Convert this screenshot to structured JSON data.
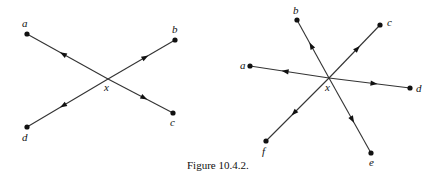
{
  "caption": "Figure 10.4.2.",
  "colors": {
    "ink": "#111111",
    "edge": "#333333",
    "background": "#ffffff"
  },
  "figures": [
    {
      "id": "left",
      "center": {
        "label": "x",
        "pos": [
          108,
          79
        ],
        "label_pos": [
          104,
          91
        ]
      },
      "nodes": [
        {
          "label": "a",
          "pos": [
            27,
            34
          ],
          "label_pos": [
            22,
            27
          ]
        },
        {
          "label": "b",
          "pos": [
            175,
            40
          ],
          "label_pos": [
            172,
            33
          ]
        },
        {
          "label": "c",
          "pos": [
            173,
            113
          ],
          "label_pos": [
            170,
            126
          ]
        },
        {
          "label": "d",
          "pos": [
            27,
            127
          ],
          "label_pos": [
            22,
            141
          ]
        }
      ],
      "edges": [
        {
          "from": "x",
          "to": "a",
          "arrow_direction": "outward"
        },
        {
          "from": "x",
          "to": "b",
          "arrow_direction": "outward"
        },
        {
          "from": "x",
          "to": "c",
          "arrow_direction": "outward"
        },
        {
          "from": "x",
          "to": "d",
          "arrow_direction": "outward"
        }
      ]
    },
    {
      "id": "right",
      "center": {
        "label": "x",
        "pos": [
          329,
          78
        ],
        "label_pos": [
          325,
          91
        ]
      },
      "nodes": [
        {
          "label": "a",
          "pos": [
            250,
            66
          ],
          "label_pos": [
            240,
            69
          ]
        },
        {
          "label": "b",
          "pos": [
            297,
            20
          ],
          "label_pos": [
            293,
            14
          ]
        },
        {
          "label": "c",
          "pos": [
            380,
            25
          ],
          "label_pos": [
            387,
            26
          ]
        },
        {
          "label": "d",
          "pos": [
            410,
            88
          ],
          "label_pos": [
            416,
            92
          ]
        },
        {
          "label": "e",
          "pos": [
            371,
            153
          ],
          "label_pos": [
            369,
            166
          ]
        },
        {
          "label": "f",
          "pos": [
            266,
            141
          ],
          "label_pos": [
            262,
            155
          ]
        }
      ],
      "edges": [
        {
          "from": "x",
          "to": "a",
          "arrow_direction": "outward"
        },
        {
          "from": "x",
          "to": "b",
          "arrow_direction": "outward"
        },
        {
          "from": "x",
          "to": "c",
          "arrow_direction": "outward"
        },
        {
          "from": "x",
          "to": "d",
          "arrow_direction": "outward"
        },
        {
          "from": "x",
          "to": "e",
          "arrow_direction": "outward"
        },
        {
          "from": "x",
          "to": "f",
          "arrow_direction": "outward"
        }
      ]
    }
  ]
}
